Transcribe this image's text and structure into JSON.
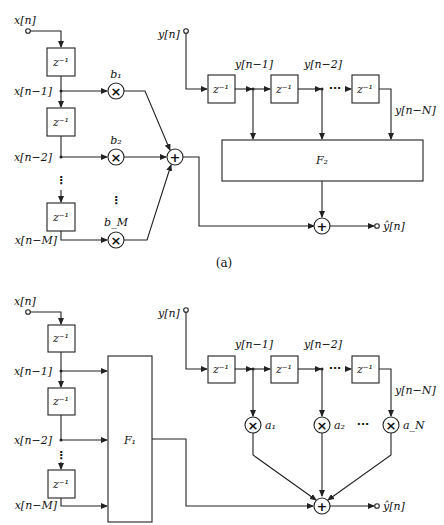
{
  "figure": {
    "caption_a": "(a)",
    "colors": {
      "line": "#222222",
      "background": "#ffffff"
    }
  },
  "diagram_a": {
    "input_x": "x[n]",
    "input_y": "y[n]",
    "delay_label": "z⁻¹",
    "x_taps": [
      "x[n−1]",
      "x[n−2]",
      "x[n−M]"
    ],
    "y_taps": [
      "y[n−1]",
      "y[n−2]",
      "y[n−N]"
    ],
    "coefficients": [
      "b₁",
      "b₂",
      "b_M"
    ],
    "multiplier_symbol": "×",
    "adder_symbol": "+",
    "vertical_ellipsis": "⋮",
    "horizontal_ellipsis": "···",
    "block_f2": "F₂",
    "output": "ŷ[n]"
  },
  "diagram_b": {
    "input_x": "x[n]",
    "input_y": "y[n]",
    "delay_label": "z⁻¹",
    "x_taps": [
      "x[n−1]",
      "x[n−2]",
      "x[n−M]"
    ],
    "y_taps": [
      "y[n−1]",
      "y[n−2]",
      "y[n−N]"
    ],
    "coefficients": [
      "a₁",
      "a₂",
      "a_N"
    ],
    "multiplier_symbol": "×",
    "adder_symbol": "+",
    "vertical_ellipsis": "⋮",
    "horizontal_ellipsis": "···",
    "block_f1": "F₁",
    "output": "ŷ[n]"
  }
}
